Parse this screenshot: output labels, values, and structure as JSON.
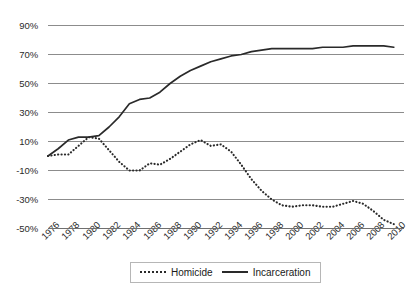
{
  "chart_data": {
    "type": "line",
    "title": "",
    "xlabel": "",
    "ylabel": "",
    "grid": true,
    "legend_position": "bottom-center",
    "ylim": [
      -50,
      90
    ],
    "ytick_labels": [
      "90%",
      "70%",
      "50%",
      "30%",
      "10%",
      "-10%",
      "-30%",
      "-50%"
    ],
    "ytick_values": [
      90,
      70,
      50,
      30,
      10,
      -10,
      -30,
      -50
    ],
    "xlim": [
      1976,
      2011
    ],
    "xtick_labels": [
      "1976",
      "1978",
      "1980",
      "1982",
      "1984",
      "1986",
      "1988",
      "1990",
      "1992",
      "1994",
      "1996",
      "1998",
      "2000",
      "2002",
      "2004",
      "2006",
      "2008",
      "2010"
    ],
    "xtick_values": [
      1976,
      1978,
      1980,
      1982,
      1984,
      1986,
      1988,
      1990,
      1992,
      1994,
      1996,
      1998,
      2000,
      2002,
      2004,
      2006,
      2008,
      2010
    ],
    "x": [
      1976,
      1977,
      1978,
      1979,
      1980,
      1981,
      1982,
      1983,
      1984,
      1985,
      1986,
      1987,
      1988,
      1989,
      1990,
      1991,
      1992,
      1993,
      1994,
      1995,
      1996,
      1997,
      1998,
      1999,
      2000,
      2001,
      2002,
      2003,
      2004,
      2005,
      2006,
      2007,
      2008,
      2009,
      2010
    ],
    "series": [
      {
        "name": "Homicide",
        "style": "dotted",
        "color": "#2a2a2a",
        "values": [
          0,
          1,
          1,
          7,
          13,
          12,
          4,
          -4,
          -10,
          -10,
          -5,
          -6,
          -2,
          3,
          8,
          11,
          7,
          8,
          3,
          -6,
          -16,
          -24,
          -30,
          -34,
          -35,
          -34,
          -34,
          -35,
          -35,
          -33,
          -31,
          -33,
          -38,
          -44,
          -47
        ]
      },
      {
        "name": "Incarceration",
        "style": "solid",
        "color": "#2a2a2a",
        "values": [
          0,
          5,
          11,
          13,
          13,
          14,
          20,
          27,
          36,
          39,
          40,
          44,
          50,
          55,
          59,
          62,
          65,
          67,
          69,
          70,
          72,
          73,
          74,
          74,
          74,
          74,
          74,
          75,
          75,
          75,
          76,
          76,
          76,
          76,
          75
        ]
      }
    ],
    "legend": [
      {
        "label": "Homicide",
        "style": "dotted"
      },
      {
        "label": "Incarceration",
        "style": "solid"
      }
    ]
  }
}
